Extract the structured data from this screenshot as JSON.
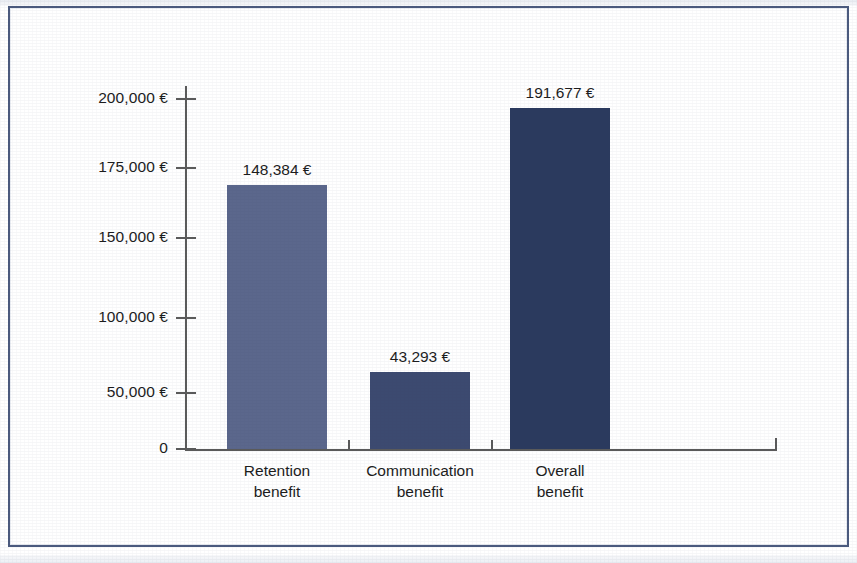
{
  "chart_data": {
    "type": "bar",
    "title": "",
    "subtitle": "",
    "xlabel": "",
    "ylabel": "",
    "categories": [
      "Retention benefit",
      "Communication benefit",
      "Overall benefit"
    ],
    "category_lines": [
      [
        "Retention",
        "benefit"
      ],
      [
        "Communication",
        "benefit"
      ],
      [
        "Overall",
        "benefit"
      ]
    ],
    "values": [
      148384,
      43293,
      191677
    ],
    "value_labels": [
      "148,384 €",
      "43,293 €",
      "191,677 €"
    ],
    "bar_colors": [
      "#5b678c",
      "#3c4a70",
      "#2b3a5e"
    ],
    "ylim": [
      0,
      200000
    ],
    "ytick_values": [
      200000,
      175000,
      150000,
      100000,
      50000,
      0
    ],
    "ytick_labels": [
      "200,000 €",
      "175,000 €",
      "150,000 €",
      "100,000 €",
      "50,000 €",
      "0"
    ],
    "grid": false,
    "legend": null,
    "currency": "€"
  },
  "figure": {
    "frame_color": "#4b5a7e",
    "axis_color": "#5a5a5a",
    "text_color": "#1c1c1c",
    "background": "#ffffff"
  }
}
